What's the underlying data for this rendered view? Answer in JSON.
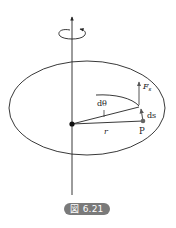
{
  "figure": {
    "caption": "図 6.21",
    "labels": {
      "angle": "dθ",
      "radius": "r",
      "point": "P",
      "arc_length": "ds",
      "force": "F",
      "force_subscript": "s"
    }
  },
  "colors": {
    "stroke": "#222222",
    "point": "#666666",
    "badge_bg": "#7a7a7a",
    "badge_text": "#ffffff"
  }
}
